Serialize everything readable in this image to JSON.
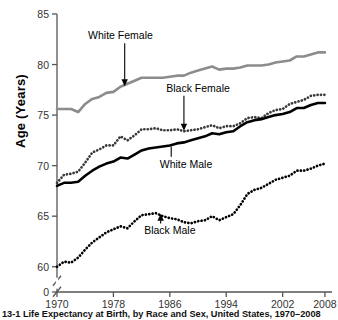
{
  "figure": {
    "caption": "13-1  Life Expectancy at Birth, by Race and Sex, United States, 1970–2008",
    "ylabel": "Age (Years)"
  },
  "chart_data": {
    "type": "line",
    "title": "",
    "xlabel": "",
    "ylabel": "Age (Years)",
    "xlim": [
      1970,
      2009
    ],
    "ylim": [
      57.5,
      85
    ],
    "y_axis_break": true,
    "y_break_label": "0",
    "grid": false,
    "legend": "inline-annotations",
    "xticks": [
      1970,
      1978,
      1986,
      1994,
      2002,
      2008
    ],
    "xtick_labels": [
      "1970",
      "1978",
      "1986",
      "1994",
      "2002",
      "2008"
    ],
    "yticks": [
      60,
      65,
      70,
      75,
      80,
      85
    ],
    "ytick_labels": [
      "60",
      "65",
      "70",
      "75",
      "80",
      "85"
    ],
    "x": [
      1970,
      1971,
      1972,
      1973,
      1974,
      1975,
      1976,
      1977,
      1978,
      1979,
      1980,
      1981,
      1982,
      1983,
      1984,
      1985,
      1986,
      1987,
      1988,
      1989,
      1990,
      1991,
      1992,
      1993,
      1994,
      1995,
      1996,
      1997,
      1998,
      1999,
      2000,
      2001,
      2002,
      2003,
      2004,
      2005,
      2006,
      2007,
      2008
    ],
    "series": [
      {
        "name": "White Female",
        "style": "solid",
        "color": "#8c8c8c",
        "width": 2.6,
        "values": [
          75.6,
          75.6,
          75.6,
          75.3,
          76.1,
          76.6,
          76.8,
          77.2,
          77.3,
          77.8,
          78.1,
          78.4,
          78.7,
          78.7,
          78.7,
          78.7,
          78.8,
          78.9,
          78.9,
          79.2,
          79.4,
          79.6,
          79.8,
          79.5,
          79.6,
          79.6,
          79.7,
          79.9,
          79.9,
          79.9,
          80.0,
          80.2,
          80.3,
          80.4,
          80.8,
          80.8,
          81.0,
          81.2,
          81.2
        ]
      },
      {
        "name": "Black Female",
        "style": "dotted",
        "color": "#3a3a3a",
        "width": 2.2,
        "values": [
          68.3,
          69.1,
          69.2,
          69.4,
          70.3,
          71.3,
          71.6,
          72.0,
          72.0,
          72.9,
          72.5,
          73.0,
          73.6,
          73.6,
          73.7,
          73.5,
          73.5,
          73.6,
          73.4,
          73.5,
          73.6,
          73.8,
          74.0,
          73.7,
          73.9,
          73.9,
          74.2,
          74.7,
          74.8,
          74.7,
          75.2,
          75.5,
          75.6,
          76.1,
          76.3,
          76.5,
          76.9,
          77.0,
          77.0
        ]
      },
      {
        "name": "White Male",
        "style": "solid",
        "color": "#000000",
        "width": 2.6,
        "values": [
          68.0,
          68.3,
          68.3,
          68.4,
          69.0,
          69.5,
          69.9,
          70.2,
          70.4,
          70.8,
          70.7,
          71.1,
          71.5,
          71.7,
          71.8,
          71.9,
          72.0,
          72.2,
          72.3,
          72.5,
          72.7,
          72.9,
          73.2,
          73.1,
          73.3,
          73.4,
          73.9,
          74.3,
          74.5,
          74.6,
          74.8,
          75.0,
          75.1,
          75.3,
          75.7,
          75.7,
          76.0,
          76.2,
          76.2
        ]
      },
      {
        "name": "Black Male",
        "style": "dotted",
        "color": "#000000",
        "width": 2.2,
        "values": [
          60.0,
          60.5,
          60.4,
          60.9,
          61.7,
          62.4,
          62.9,
          63.4,
          63.7,
          64.0,
          63.8,
          64.5,
          65.1,
          65.2,
          65.3,
          65.0,
          64.8,
          64.7,
          64.4,
          64.3,
          64.5,
          64.6,
          65.0,
          64.6,
          64.9,
          65.2,
          66.1,
          67.2,
          67.6,
          67.8,
          68.2,
          68.6,
          68.8,
          69.0,
          69.5,
          69.5,
          69.7,
          70.0,
          70.2
        ]
      }
    ],
    "annotations": [
      {
        "label": "White Female",
        "text_x": 1979.0,
        "text_y": 82.5,
        "point_x": 1979.6,
        "point_y": 77.8,
        "arrow": true
      },
      {
        "label": "Black Female",
        "text_x": 1990.0,
        "text_y": 77.3,
        "point_x": 1988.0,
        "point_y": 73.4,
        "arrow": true
      },
      {
        "label": "White Male",
        "text_x": 1988.3,
        "text_y": 69.8,
        "point_x": 1986.2,
        "point_y": 72.0,
        "arrow": false
      },
      {
        "label": "Black Male",
        "text_x": 1986.0,
        "text_y": 63.2,
        "point_x": 1984.7,
        "point_y": 65.3,
        "arrow": true
      }
    ]
  }
}
